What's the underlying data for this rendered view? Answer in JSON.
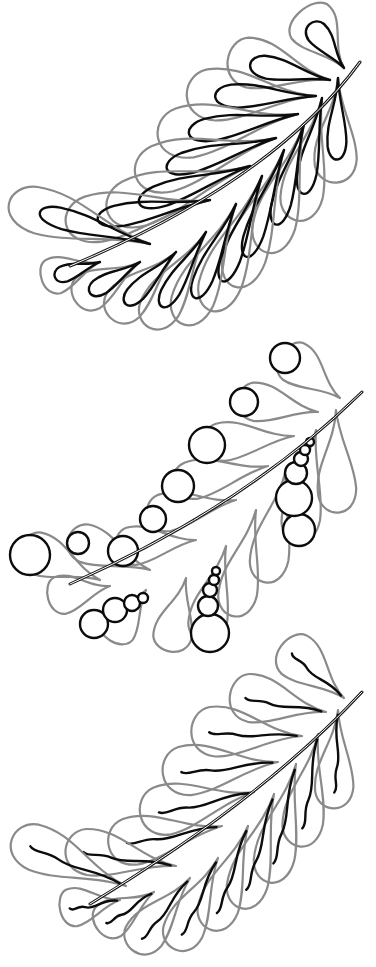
{
  "canvas": {
    "width": 376,
    "height": 967,
    "background": "#ffffff"
  },
  "colors": {
    "outer_stroke": "#8a8a8a",
    "inner_stroke": "#0c0c0c",
    "spine": "#1a1a1a"
  },
  "feathers": [
    {
      "id": "teardrop-feather",
      "variant": "teardrop-fill",
      "offset_y": 0,
      "tip": [
        360,
        62
      ],
      "top_plumes": [
        {
          "base": [
            344,
            68
          ],
          "tip": [
            300,
            14
          ],
          "w": 26
        },
        {
          "base": [
            330,
            80
          ],
          "tip": [
            230,
            62
          ],
          "w": 26
        },
        {
          "base": [
            316,
            96
          ],
          "tip": [
            190,
            98
          ],
          "w": 27
        },
        {
          "base": [
            298,
            114
          ],
          "tip": [
            162,
            140
          ],
          "w": 27
        },
        {
          "base": [
            276,
            138
          ],
          "tip": [
            140,
            178
          ],
          "w": 26
        },
        {
          "base": [
            250,
            166
          ],
          "tip": [
            112,
            214
          ],
          "w": 26
        },
        {
          "base": [
            210,
            200
          ],
          "tip": [
            70,
            226
          ],
          "w": 25
        },
        {
          "base": [
            150,
            244
          ],
          "tip": [
            12,
            206
          ],
          "w": 24
        }
      ],
      "bottom_plumes": [
        {
          "base": [
            338,
            78
          ],
          "tip": [
            338,
            180
          ],
          "w": 22
        },
        {
          "base": [
            322,
            98
          ],
          "tip": [
            300,
            218
          ],
          "w": 22
        },
        {
          "base": [
            304,
            124
          ],
          "tip": [
            270,
            250
          ],
          "w": 22
        },
        {
          "base": [
            284,
            150
          ],
          "tip": [
            238,
            284
          ],
          "w": 22
        },
        {
          "base": [
            262,
            176
          ],
          "tip": [
            214,
            308
          ],
          "w": 22
        },
        {
          "base": [
            236,
            204
          ],
          "tip": [
            186,
            322
          ],
          "w": 22
        },
        {
          "base": [
            206,
            232
          ],
          "tip": [
            152,
            326
          ],
          "w": 21
        },
        {
          "base": [
            176,
            252
          ],
          "tip": [
            114,
            318
          ],
          "w": 21
        },
        {
          "base": [
            140,
            262
          ],
          "tip": [
            78,
            302
          ],
          "w": 20
        },
        {
          "base": [
            100,
            262
          ],
          "tip": [
            44,
            282
          ],
          "w": 19
        }
      ]
    },
    {
      "id": "pebble-feather",
      "variant": "circle-fill",
      "offset_y": 0,
      "tip": [
        362,
        392
      ],
      "top_plumes": [
        {
          "base": [
            340,
            398
          ],
          "tip": [
            282,
            356
          ],
          "w": 22
        },
        {
          "base": [
            318,
            412
          ],
          "tip": [
            240,
            402
          ],
          "w": 20
        },
        {
          "base": [
            294,
            436
          ],
          "tip": [
            206,
            446
          ],
          "w": 20
        },
        {
          "base": [
            268,
            466
          ],
          "tip": [
            176,
            486
          ],
          "w": 20
        },
        {
          "base": [
            236,
            500
          ],
          "tip": [
            150,
            518
          ],
          "w": 20
        },
        {
          "base": [
            196,
            540
          ],
          "tip": [
            118,
            550
          ],
          "w": 20
        },
        {
          "base": [
            150,
            570
          ],
          "tip": [
            70,
            540
          ],
          "w": 20
        },
        {
          "base": [
            100,
            580
          ],
          "tip": [
            22,
            550
          ],
          "w": 22
        }
      ],
      "bottom_plumes": [
        {
          "base": [
            336,
            410
          ],
          "tip": [
            340,
            510
          ],
          "w": 20
        },
        {
          "base": [
            316,
            430
          ],
          "tip": [
            300,
            540
          ],
          "w": 20
        },
        {
          "base": [
            286,
            470
          ],
          "tip": [
            268,
            580
          ],
          "w": 20
        },
        {
          "base": [
            256,
            510
          ],
          "tip": [
            236,
            614
          ],
          "w": 20
        },
        {
          "base": [
            226,
            546
          ],
          "tip": [
            206,
            640
          ],
          "w": 20
        },
        {
          "base": [
            186,
            578
          ],
          "tip": [
            172,
            650
          ],
          "w": 20
        },
        {
          "base": [
            146,
            590
          ],
          "tip": [
            112,
            640
          ],
          "w": 20
        },
        {
          "base": [
            110,
            586
          ],
          "tip": [
            50,
            600
          ],
          "w": 20
        }
      ],
      "circles": [
        {
          "cx": 285,
          "cy": 358,
          "r": 15
        },
        {
          "cx": 244,
          "cy": 402,
          "r": 14
        },
        {
          "cx": 207,
          "cy": 445,
          "r": 18
        },
        {
          "cx": 178,
          "cy": 486,
          "r": 16
        },
        {
          "cx": 153,
          "cy": 519,
          "r": 13
        },
        {
          "cx": 123,
          "cy": 551,
          "r": 15
        },
        {
          "cx": 78,
          "cy": 543,
          "r": 11
        },
        {
          "cx": 30,
          "cy": 555,
          "r": 20
        },
        {
          "cx": 299,
          "cy": 530,
          "r": 16
        },
        {
          "cx": 294,
          "cy": 498,
          "r": 18
        },
        {
          "cx": 296,
          "cy": 473,
          "r": 11
        },
        {
          "cx": 301,
          "cy": 459,
          "r": 7
        },
        {
          "cx": 305,
          "cy": 450,
          "r": 5
        },
        {
          "cx": 310,
          "cy": 442,
          "r": 4
        },
        {
          "cx": 210,
          "cy": 633,
          "r": 19
        },
        {
          "cx": 208,
          "cy": 606,
          "r": 10
        },
        {
          "cx": 210,
          "cy": 590,
          "r": 7
        },
        {
          "cx": 214,
          "cy": 580,
          "r": 5
        },
        {
          "cx": 216,
          "cy": 571,
          "r": 4
        },
        {
          "cx": 94,
          "cy": 624,
          "r": 14
        },
        {
          "cx": 115,
          "cy": 610,
          "r": 12
        },
        {
          "cx": 132,
          "cy": 603,
          "r": 8
        },
        {
          "cx": 143,
          "cy": 598,
          "r": 5
        }
      ]
    },
    {
      "id": "flame-feather",
      "variant": "wavy-fill",
      "offset_y": 0,
      "tip": [
        362,
        692
      ],
      "top_plumes": [
        {
          "base": [
            344,
            698
          ],
          "tip": [
            282,
            648
          ],
          "w": 24
        },
        {
          "base": [
            326,
            712
          ],
          "tip": [
            232,
            698
          ],
          "w": 25
        },
        {
          "base": [
            302,
            736
          ],
          "tip": [
            194,
            734
          ],
          "w": 26
        },
        {
          "base": [
            278,
            762
          ],
          "tip": [
            166,
            776
          ],
          "w": 26
        },
        {
          "base": [
            254,
            792
          ],
          "tip": [
            144,
            818
          ],
          "w": 26
        },
        {
          "base": [
            222,
            826
          ],
          "tip": [
            112,
            848
          ],
          "w": 25
        },
        {
          "base": [
            176,
            866
          ],
          "tip": [
            68,
            852
          ],
          "w": 24
        },
        {
          "base": [
            126,
            886
          ],
          "tip": [
            14,
            842
          ],
          "w": 24
        }
      ],
      "bottom_plumes": [
        {
          "base": [
            338,
            710
          ],
          "tip": [
            336,
            806
          ],
          "w": 20
        },
        {
          "base": [
            318,
            734
          ],
          "tip": [
            302,
            844
          ],
          "w": 21
        },
        {
          "base": [
            296,
            764
          ],
          "tip": [
            272,
            880
          ],
          "w": 21
        },
        {
          "base": [
            274,
            794
          ],
          "tip": [
            244,
            906
          ],
          "w": 21
        },
        {
          "base": [
            248,
            826
          ],
          "tip": [
            214,
            928
          ],
          "w": 21
        },
        {
          "base": [
            218,
            858
          ],
          "tip": [
            178,
            948
          ],
          "w": 21
        },
        {
          "base": [
            190,
            878
          ],
          "tip": [
            136,
            950
          ],
          "w": 21
        },
        {
          "base": [
            154,
            892
          ],
          "tip": [
            100,
            930
          ],
          "w": 20
        },
        {
          "base": [
            120,
            900
          ],
          "tip": [
            62,
            912
          ],
          "w": 20
        }
      ]
    }
  ]
}
